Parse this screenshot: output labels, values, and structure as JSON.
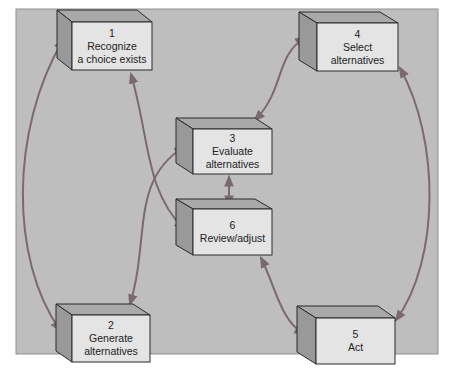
{
  "diagram": {
    "title": "",
    "colors": {
      "page_background": "#ffffff",
      "panel_background": "#bebebe",
      "panel_border": "#8f8f8f",
      "box_front": "#e4e4e4",
      "box_top": "#a9a9a9",
      "box_side": "#999999",
      "box_outline": "#2a2a2a",
      "arrow": "#7a6a6e"
    },
    "steps": [
      {
        "id": "1",
        "number": "1",
        "line1": "Recognize",
        "line2": "a choice exists"
      },
      {
        "id": "2",
        "number": "2",
        "line1": "Generate",
        "line2": "alternatives"
      },
      {
        "id": "3",
        "number": "3",
        "line1": "Evaluate",
        "line2": "alternatives"
      },
      {
        "id": "4",
        "number": "4",
        "line1": "Select",
        "line2": "alternatives"
      },
      {
        "id": "5",
        "number": "5",
        "line1": "Act",
        "line2": ""
      },
      {
        "id": "6",
        "number": "6",
        "line1": "Review/adjust",
        "line2": ""
      }
    ],
    "connections": [
      {
        "from": "1",
        "to": "2",
        "bidirectional": true
      },
      {
        "from": "1",
        "to": "6",
        "bidirectional": true
      },
      {
        "from": "2",
        "to": "3",
        "bidirectional": true
      },
      {
        "from": "3",
        "to": "4",
        "bidirectional": true
      },
      {
        "from": "3",
        "to": "6",
        "bidirectional": true
      },
      {
        "from": "6",
        "to": "5",
        "bidirectional": true
      },
      {
        "from": "4",
        "to": "5",
        "bidirectional": true
      }
    ]
  }
}
